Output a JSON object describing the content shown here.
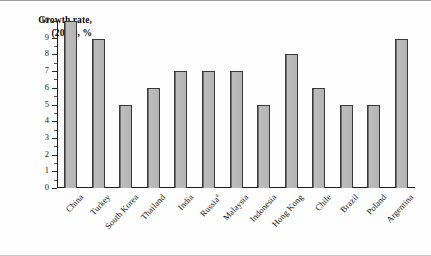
{
  "chart_data": {
    "type": "bar",
    "title": "Growth rate, (2004), %",
    "title_line1": "Growth rate,",
    "title_line2": "(2004), %",
    "xlabel": "",
    "ylabel": "Growth rate, (2004), %",
    "ylim": [
      0,
      10
    ],
    "ytick_labels": [
      "0",
      "1",
      "2",
      "3",
      "4",
      "5",
      "6",
      "7",
      "8",
      "9",
      "10"
    ],
    "grid": false,
    "legend": "none",
    "categories": [
      "China",
      "Turkey",
      "South Korea",
      "Thailand",
      "India",
      "Russia",
      "Malaysia",
      "Indonesia",
      "Hong Kong",
      "Chile",
      "Brazil",
      "Poland",
      "Argentina"
    ],
    "values": [
      10.0,
      8.9,
      5.0,
      6.0,
      7.0,
      7.0,
      7.0,
      5.0,
      8.0,
      6.0,
      5.0,
      5.0,
      8.9
    ],
    "footnote_markers": {
      "Russia": "a"
    },
    "bars": [
      {
        "label": "China",
        "value": 10.0,
        "marker": ""
      },
      {
        "label": "Turkey",
        "value": 8.9,
        "marker": ""
      },
      {
        "label": "South Korea",
        "value": 5.0,
        "marker": ""
      },
      {
        "label": "Thailand",
        "value": 6.0,
        "marker": ""
      },
      {
        "label": "India",
        "value": 7.0,
        "marker": ""
      },
      {
        "label": "Russia",
        "value": 7.0,
        "marker": "a"
      },
      {
        "label": "Malaysia",
        "value": 7.0,
        "marker": ""
      },
      {
        "label": "Indonesia",
        "value": 5.0,
        "marker": ""
      },
      {
        "label": "Hong Kong",
        "value": 8.0,
        "marker": ""
      },
      {
        "label": "Chile",
        "value": 6.0,
        "marker": ""
      },
      {
        "label": "Brazil",
        "value": 5.0,
        "marker": ""
      },
      {
        "label": "Poland",
        "value": 5.0,
        "marker": ""
      },
      {
        "label": "Argentina",
        "value": 8.9,
        "marker": ""
      }
    ],
    "colors": {
      "bar_fill": "#b4b4b4",
      "bar_border": "#3a3a3a",
      "axis": "#1d1d1d",
      "text": "#111111",
      "background": "#fefefe"
    }
  }
}
